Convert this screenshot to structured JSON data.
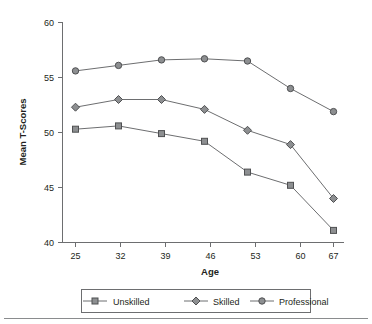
{
  "chart_data": {
    "type": "line",
    "title": "",
    "xlabel": "Age",
    "ylabel": "Mean T-Scores",
    "categories": [
      "25",
      "32",
      "39",
      "46",
      "53",
      "60",
      "67"
    ],
    "x": [
      25,
      32,
      39,
      46,
      53,
      60,
      67
    ],
    "xlim": [
      25,
      67
    ],
    "ylim": [
      40,
      60
    ],
    "yticks": [
      "40",
      "45",
      "50",
      "55",
      "60"
    ],
    "ytick_values": [
      40,
      45,
      50,
      55,
      60
    ],
    "grid": false,
    "legend_position": "bottom",
    "series": [
      {
        "name": "Unskilled",
        "marker": "square",
        "values": [
          50.3,
          50.6,
          49.9,
          49.2,
          46.4,
          45.2,
          41.1
        ]
      },
      {
        "name": "Skilled",
        "marker": "diamond",
        "values": [
          52.3,
          53.0,
          53.0,
          52.1,
          50.2,
          48.9,
          44.0
        ]
      },
      {
        "name": "Professional",
        "marker": "circle",
        "values": [
          55.6,
          56.1,
          56.6,
          56.7,
          56.5,
          54.0,
          51.9
        ]
      }
    ],
    "colors": {
      "line": "#6d6e70",
      "marker_fill": "#8d8f91",
      "marker_stroke": "#4f5052",
      "axis": "#6d6e70",
      "text": "#231f20",
      "background": "#ffffff"
    }
  },
  "legend": {
    "items": [
      {
        "label": "Unskilled",
        "marker": "square"
      },
      {
        "label": "Skilled",
        "marker": "diamond"
      },
      {
        "label": "Professional",
        "marker": "circle"
      }
    ]
  },
  "axes": {
    "y_title": "Mean T-Scores",
    "x_title": "Age",
    "y_tick_labels": [
      "60",
      "55",
      "50",
      "45",
      "40"
    ],
    "x_tick_labels": [
      "25",
      "32",
      "39",
      "46",
      "53",
      "60",
      "67"
    ]
  }
}
